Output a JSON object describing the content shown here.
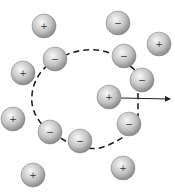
{
  "diagram": {
    "title": "",
    "colors": {
      "ion_fill_light": "#f2f2f2",
      "ion_fill_dark": "#8a8a8a",
      "ion_stroke": "#777777",
      "line": "#222222"
    },
    "ions": [
      {
        "sign": "+",
        "x": 44,
        "y": 26
      },
      {
        "sign": "−",
        "x": 118,
        "y": 23
      },
      {
        "sign": "+",
        "x": 159,
        "y": 44
      },
      {
        "sign": "−",
        "x": 55,
        "y": 59
      },
      {
        "sign": "−",
        "x": 124,
        "y": 56
      },
      {
        "sign": "+",
        "x": 23,
        "y": 73
      },
      {
        "sign": "−",
        "x": 142,
        "y": 80
      },
      {
        "sign": "+",
        "x": 109,
        "y": 97
      },
      {
        "sign": "+",
        "x": 13,
        "y": 119
      },
      {
        "sign": "−",
        "x": 129,
        "y": 124
      },
      {
        "sign": "−",
        "x": 50,
        "y": 132
      },
      {
        "sign": "−",
        "x": 80,
        "y": 141
      },
      {
        "sign": "+",
        "x": 123,
        "y": 168
      },
      {
        "sign": "+",
        "x": 33,
        "y": 175
      }
    ],
    "arrow": {
      "from": [
        121,
        97
      ],
      "to": [
        170,
        99
      ],
      "label": ""
    }
  }
}
